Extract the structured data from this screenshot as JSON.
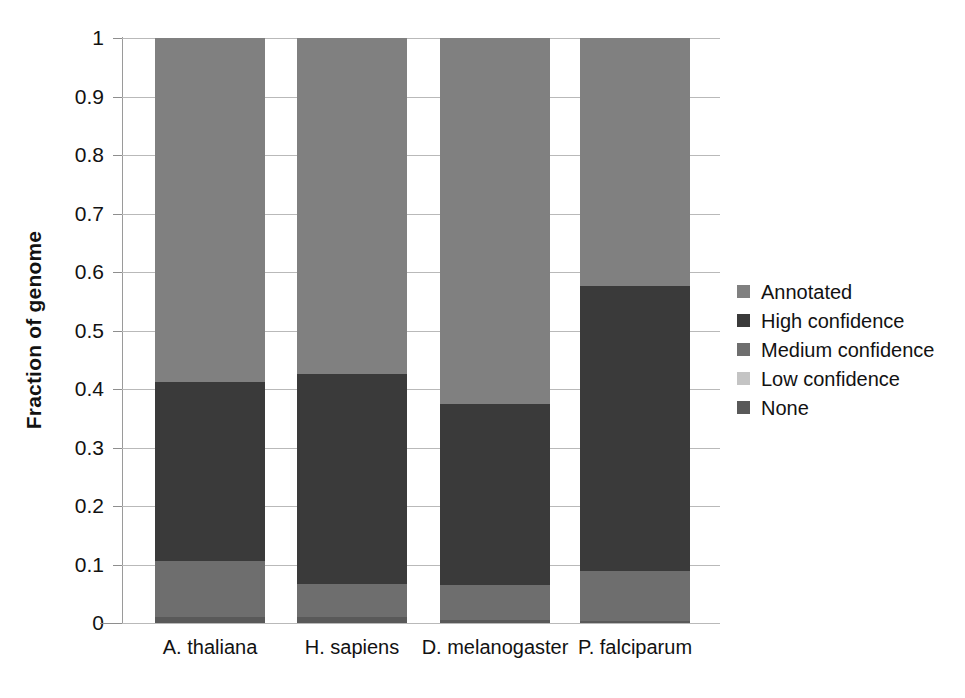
{
  "chart_data": {
    "type": "bar",
    "subtype": "stacked-bar-100pct",
    "title": "",
    "xlabel": "",
    "ylabel": "Fraction of genome",
    "ylim": [
      0,
      1
    ],
    "yticks": [
      0,
      0.1,
      0.2,
      0.3,
      0.4,
      0.5,
      0.6,
      0.7,
      0.8,
      0.9,
      1
    ],
    "ytick_labels": [
      "0",
      "0.1",
      "0.2",
      "0.3",
      "0.4",
      "0.5",
      "0.6",
      "0.7",
      "0.8",
      "0.9",
      "1"
    ],
    "grid": true,
    "grid_axis": "y",
    "legend_position": "right",
    "categories": [
      "A. thaliana",
      "H. sapiens",
      "D. melanogaster",
      "P. falciparum"
    ],
    "stack_order_bottom_to_top": [
      "None",
      "Low confidence",
      "Medium confidence",
      "High confidence",
      "Annotated"
    ],
    "series": [
      {
        "name": "Annotated",
        "color": "#808080",
        "values": [
          0.588,
          0.575,
          0.625,
          0.424
        ]
      },
      {
        "name": "High confidence",
        "color": "#3a3a3a",
        "values": [
          0.306,
          0.358,
          0.31,
          0.487
        ]
      },
      {
        "name": "Medium confidence",
        "color": "#6e6e6e",
        "values": [
          0.096,
          0.057,
          0.06,
          0.086
        ]
      },
      {
        "name": "Low confidence",
        "color": "#c4c4c4",
        "values": [
          0.0,
          0.0,
          0.0,
          0.0
        ]
      },
      {
        "name": "None",
        "color": "#595959",
        "values": [
          0.01,
          0.01,
          0.005,
          0.003
        ]
      }
    ],
    "cumulative_boundaries_bottom_to_top": {
      "A. thaliana": [
        0.01,
        0.01,
        0.106,
        0.412,
        1.0
      ],
      "H. sapiens": [
        0.01,
        0.01,
        0.067,
        0.425,
        1.0
      ],
      "D. melanogaster": [
        0.005,
        0.005,
        0.065,
        0.375,
        1.0
      ],
      "P. falciparum": [
        0.003,
        0.003,
        0.089,
        0.576,
        1.0
      ]
    }
  },
  "legend": {
    "items": [
      {
        "label": "Annotated",
        "color": "#808080"
      },
      {
        "label": "High confidence",
        "color": "#3a3a3a"
      },
      {
        "label": "Medium confidence",
        "color": "#6e6e6e"
      },
      {
        "label": "Low confidence",
        "color": "#c4c4c4"
      },
      {
        "label": "None",
        "color": "#595959"
      }
    ]
  },
  "axes": {
    "y_title": "Fraction of genome",
    "y_tick_labels": [
      "1",
      "0.9",
      "0.8",
      "0.7",
      "0.6",
      "0.5",
      "0.4",
      "0.3",
      "0.2",
      "0.1",
      "0"
    ],
    "x_tick_labels": [
      "A. thaliana",
      "H. sapiens",
      "D. melanogaster",
      "P. falciparum"
    ]
  },
  "colors": {
    "annotated": "#808080",
    "high_confidence": "#3a3a3a",
    "medium_confidence": "#6e6e6e",
    "low_confidence": "#c4c4c4",
    "none": "#595959",
    "gridline": "#b9b9b9",
    "axis": "#8e8e8e",
    "text": "#121212",
    "background": "#ffffff"
  }
}
